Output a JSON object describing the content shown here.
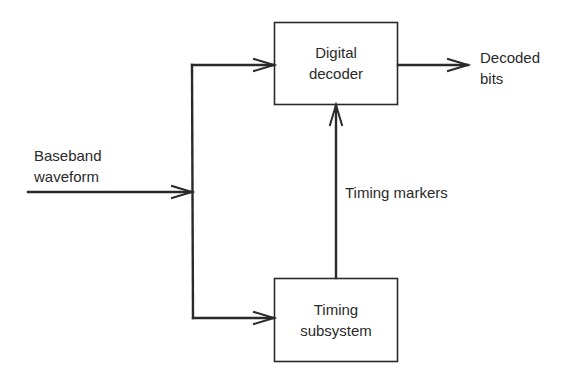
{
  "diagram": {
    "type": "block-diagram",
    "colors": {
      "stroke": "#2a2a2a",
      "background": "#ffffff",
      "text": "#2a2a2a"
    },
    "blocks": [
      {
        "id": "digital_decoder",
        "label_lines": [
          "Digital",
          "decoder"
        ]
      },
      {
        "id": "timing_subsystem",
        "label_lines": [
          "Timing",
          "subsystem"
        ]
      }
    ],
    "signals": {
      "input": {
        "label_lines": [
          "Baseband",
          "waveform"
        ]
      },
      "output": {
        "label_lines": [
          "Decoded",
          "bits"
        ]
      },
      "timing": {
        "label": "Timing markers"
      }
    },
    "edges": [
      {
        "from": "input",
        "to": "digital_decoder"
      },
      {
        "from": "input",
        "to": "timing_subsystem"
      },
      {
        "from": "timing_subsystem",
        "to": "digital_decoder",
        "label": "Timing markers"
      },
      {
        "from": "digital_decoder",
        "to": "output"
      }
    ]
  }
}
